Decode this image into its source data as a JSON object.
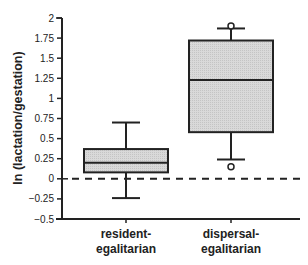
{
  "chart_data": {
    "type": "box",
    "title": "",
    "xlabel": "",
    "ylabel": "ln (lactation/gestation)",
    "ylim": [
      -0.5,
      2
    ],
    "yticks": [
      -0.5,
      -0.25,
      0,
      0.25,
      0.5,
      0.75,
      1,
      1.25,
      1.5,
      1.75,
      2
    ],
    "ytick_labels": [
      "-0.5",
      "-0.25",
      "0",
      "0.25",
      "0.5",
      "0.75",
      "1",
      "1.25",
      "1.5",
      "1.75",
      "2"
    ],
    "categories": [
      "resident-egalitarian",
      "dispersal-egalitarian"
    ],
    "category_lines": [
      [
        "resident-",
        "egalitarian"
      ],
      [
        "dispersal-",
        "egalitarian"
      ]
    ],
    "series": [
      {
        "name": "resident-egalitarian",
        "whisker_low": -0.24,
        "q1": 0.08,
        "median": 0.2,
        "q3": 0.37,
        "whisker_high": 0.7,
        "outliers": []
      },
      {
        "name": "dispersal-egalitarian",
        "whisker_low": 0.24,
        "q1": 0.58,
        "median": 1.23,
        "q3": 1.72,
        "whisker_high": 1.87,
        "outliers": [
          0.15,
          1.9
        ]
      }
    ],
    "reference_line": {
      "y": 0,
      "style": "dashed"
    },
    "grid": false,
    "legend": null
  },
  "colors": {
    "box_fill": "#d9d9d9",
    "stroke": "#222222"
  }
}
